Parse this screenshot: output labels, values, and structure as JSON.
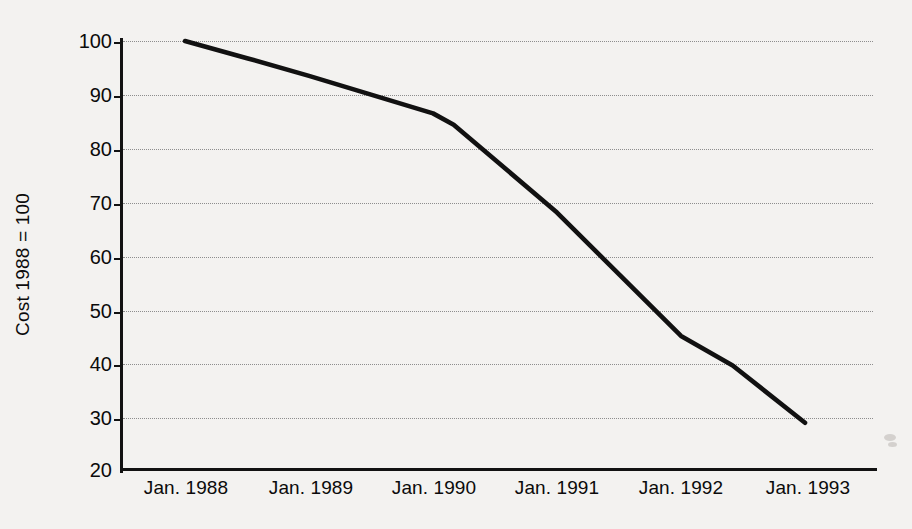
{
  "chart_data": {
    "type": "line",
    "title": "",
    "subtitle": "",
    "xlabel": "",
    "ylabel": "Cost 1988 = 100",
    "grid": true,
    "legend": false,
    "legend_position": "none",
    "line_color": "#111111",
    "background_color": "#f3f2f0",
    "gridline_color": "#8d8d8d",
    "axis_color": "#121212",
    "xlim": [
      "Jan. 1988",
      "Jan. 1993"
    ],
    "ylim": [
      20,
      100
    ],
    "ytick_values": [
      20,
      30,
      40,
      50,
      60,
      70,
      80,
      90,
      100
    ],
    "ytick_labels": [
      "20",
      "30",
      "40",
      "50",
      "60",
      "70",
      "80",
      "90",
      "100"
    ],
    "categories": [
      "Jan. 1988",
      "Jan. 1989",
      "Jan. 1990",
      "Jan. 1991",
      "Jan. 1992",
      "Jan. 1993"
    ],
    "xtick_labels": [
      "Jan. 1988",
      "Jan. 1989",
      "Jan. 1990",
      "Jan. 1991",
      "Jan. 1992",
      "Jan. 1993"
    ],
    "values": [
      100,
      93.5,
      86.5,
      68.0,
      45.0,
      28.8
    ],
    "series": [
      {
        "name": "Cost index",
        "x": [
          "Jan. 1988",
          "Jan. 1989",
          "Jan. 1990",
          "Jan. 1991",
          "Jan. 1992",
          "Jan. 1993"
        ],
        "values": [
          100,
          93.5,
          86.5,
          68.0,
          45.0,
          28.8
        ],
        "detail_points": [
          {
            "x": "Jan. 1988",
            "y": 100.0
          },
          {
            "x": "Jul. 1988",
            "y": 96.8
          },
          {
            "x": "Jan. 1989",
            "y": 93.5
          },
          {
            "x": "Jul. 1989",
            "y": 90.0
          },
          {
            "x": "Jan. 1990",
            "y": 86.5
          },
          {
            "x": "Mar. 1990",
            "y": 84.4
          },
          {
            "x": "Jan. 1991",
            "y": 68.0
          },
          {
            "x": "Jan. 1992",
            "y": 45.0
          },
          {
            "x": "Jun. 1992",
            "y": 39.5
          },
          {
            "x": "Jan. 1993",
            "y": 28.8
          }
        ],
        "annotations": []
      }
    ]
  },
  "axes": {
    "ytick_labels": [
      "100",
      "90",
      "80",
      "70",
      "60",
      "50",
      "40",
      "30",
      "20"
    ],
    "xtick_labels": [
      "Jan. 1988",
      "Jan. 1989",
      "Jan. 1990",
      "Jan. 1991",
      "Jan. 1992",
      "Jan. 1993"
    ],
    "y_axis_title": "Cost 1988 = 100"
  }
}
